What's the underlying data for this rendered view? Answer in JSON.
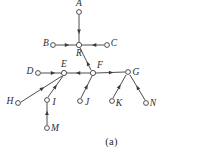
{
  "figure": {
    "caption": "(a)",
    "stroke_color": "#3a3a3a",
    "node_fill_color": "#ffffff",
    "background_color": "#ffffff",
    "label_color": "#2b2b2b"
  },
  "chart_data": {
    "type": "diagram",
    "title": "(a)",
    "nodes": [
      {
        "id": "A",
        "label": "A",
        "cx": 79,
        "cy": 12,
        "r": 2.4,
        "label_x": 79,
        "label_y": 4,
        "label_anchor": "middle"
      },
      {
        "id": "B",
        "label": "B",
        "cx": 53,
        "cy": 45,
        "r": 2.4,
        "label_x": 46,
        "label_y": 44,
        "label_anchor": "middle"
      },
      {
        "id": "R",
        "label": "R",
        "cx": 79,
        "cy": 45,
        "r": 2.6,
        "label_x": 79,
        "label_y": 54,
        "label_anchor": "middle"
      },
      {
        "id": "C",
        "label": "C",
        "cx": 107,
        "cy": 45,
        "r": 2.4,
        "label_x": 114,
        "label_y": 44,
        "label_anchor": "middle"
      },
      {
        "id": "D",
        "label": "D",
        "cx": 38,
        "cy": 73,
        "r": 2.4,
        "label_x": 30,
        "label_y": 72,
        "label_anchor": "middle"
      },
      {
        "id": "E",
        "label": "E",
        "cx": 64,
        "cy": 73,
        "r": 2.6,
        "label_x": 64,
        "label_y": 65,
        "label_anchor": "middle"
      },
      {
        "id": "F",
        "label": "F",
        "cx": 93,
        "cy": 73,
        "r": 2.6,
        "label_x": 100,
        "label_y": 66,
        "label_anchor": "middle"
      },
      {
        "id": "G",
        "label": "G",
        "cx": 128,
        "cy": 72,
        "r": 2.4,
        "label_x": 136,
        "label_y": 73,
        "label_anchor": "middle"
      },
      {
        "id": "H",
        "label": "H",
        "cx": 18,
        "cy": 103,
        "r": 2.4,
        "label_x": 10,
        "label_y": 102,
        "label_anchor": "middle"
      },
      {
        "id": "I",
        "label": "I",
        "cx": 47,
        "cy": 100,
        "r": 2.4,
        "label_x": 54,
        "label_y": 103,
        "label_anchor": "middle"
      },
      {
        "id": "J",
        "label": "J",
        "cx": 80,
        "cy": 101,
        "r": 2.4,
        "label_x": 87,
        "label_y": 103,
        "label_anchor": "middle"
      },
      {
        "id": "K",
        "label": "K",
        "cx": 112,
        "cy": 101,
        "r": 2.4,
        "label_x": 119,
        "label_y": 104,
        "label_anchor": "middle"
      },
      {
        "id": "N",
        "label": "N",
        "cx": 146,
        "cy": 103,
        "r": 2.4,
        "label_x": 153,
        "label_y": 104,
        "label_anchor": "middle"
      },
      {
        "id": "M",
        "label": "M",
        "cx": 47,
        "cy": 128,
        "r": 2.4,
        "label_x": 55,
        "label_y": 129,
        "label_anchor": "middle"
      }
    ],
    "edges": [
      {
        "from": "A",
        "to": "R",
        "x1": 79,
        "y1": 15,
        "x2": 79,
        "y2": 42,
        "arrow_at": 0.62
      },
      {
        "from": "B",
        "to": "R",
        "x1": 56,
        "y1": 45,
        "x2": 76,
        "y2": 45,
        "arrow_at": 0.55
      },
      {
        "from": "C",
        "to": "R",
        "x1": 104,
        "y1": 45,
        "x2": 82,
        "y2": 45,
        "arrow_at": 0.45
      },
      {
        "from": "F",
        "to": "R",
        "x1": 91,
        "y1": 70,
        "x2": 80,
        "y2": 48,
        "arrow_at": 0.3
      },
      {
        "from": "D",
        "to": "E",
        "x1": 41,
        "y1": 73,
        "x2": 61,
        "y2": 73,
        "arrow_at": 0.6
      },
      {
        "from": "F",
        "to": "E",
        "x1": 90,
        "y1": 73,
        "x2": 67,
        "y2": 73,
        "arrow_at": 0.52
      },
      {
        "from": "H",
        "to": "E",
        "x1": 21,
        "y1": 102,
        "x2": 62,
        "y2": 76,
        "arrow_at": 0.52
      },
      {
        "from": "I",
        "to": "E",
        "x1": 48,
        "y1": 97,
        "x2": 63,
        "y2": 76,
        "arrow_at": 0.5
      },
      {
        "from": "J",
        "to": "F",
        "x1": 81,
        "y1": 98,
        "x2": 92,
        "y2": 76,
        "arrow_at": 0.52
      },
      {
        "from": "F",
        "to": "G",
        "x1": 96,
        "y1": 73,
        "x2": 125,
        "y2": 72,
        "arrow_at": 0.52
      },
      {
        "from": "K",
        "to": "G",
        "x1": 113,
        "y1": 98,
        "x2": 126,
        "y2": 75,
        "arrow_at": 0.5
      },
      {
        "from": "N",
        "to": "G",
        "x1": 145,
        "y1": 100,
        "x2": 130,
        "y2": 75,
        "arrow_at": 0.5
      },
      {
        "from": "M",
        "to": "I",
        "x1": 47,
        "y1": 125,
        "x2": 47,
        "y2": 103,
        "arrow_at": 0.55
      }
    ]
  }
}
